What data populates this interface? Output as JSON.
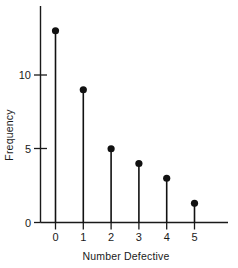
{
  "chart_data": {
    "type": "scatter",
    "variant": "stem-lollipop",
    "title": "",
    "subtitle": "",
    "xlabel": "Number Defective",
    "ylabel": "Frequency",
    "categories": [
      "0",
      "1",
      "2",
      "3",
      "4",
      "5"
    ],
    "x": [
      0,
      1,
      2,
      3,
      4,
      5
    ],
    "values": [
      13,
      9,
      5,
      4,
      3,
      1.3
    ],
    "series": [
      {
        "name": "Frequency",
        "values": [
          13,
          9,
          5,
          4,
          3,
          1.3
        ]
      }
    ],
    "xlim": [
      -0.45,
      5.85
    ],
    "ylim": [
      0,
      13.6
    ],
    "x_tick_labels": [
      "0",
      "1",
      "2",
      "3",
      "4",
      "5"
    ],
    "x_ticks": [
      0,
      1,
      2,
      3,
      4,
      5
    ],
    "y_tick_labels": [
      "0",
      "5",
      "10"
    ],
    "y_ticks": [
      0,
      5,
      10
    ],
    "grid": false,
    "legend": false,
    "legend_position": "none",
    "marker": "filled-circle",
    "marker_color": "#111111",
    "stem_color": "#111111",
    "axis_color": "#1a1a1a",
    "background_color": "#ffffff",
    "annotations": []
  }
}
